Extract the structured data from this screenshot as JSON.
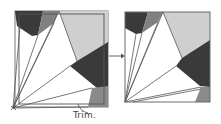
{
  "diagram": {
    "type": "quilt-block-trimming-illustration",
    "annotation": "Trim.",
    "colors": {
      "dark": "#3a3a3a",
      "medium": "#808080",
      "light": "#cfcfcf",
      "white": "#ffffff",
      "line": "#555555",
      "border": "#6a6a6a"
    },
    "figures": [
      {
        "name": "before-trim",
        "description": "Pieced fan block with untrimmed edges and inner trim line"
      },
      {
        "name": "after-trim",
        "description": "Same fan block trimmed to square"
      }
    ],
    "arrow": {
      "direction": "right",
      "meaning": "becomes"
    }
  }
}
